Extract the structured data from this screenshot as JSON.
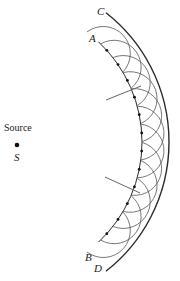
{
  "figure": {
    "labels": {
      "source": "Source",
      "source_symbol": "S",
      "point_a": "A",
      "point_b": "B",
      "point_c": "C",
      "point_d": "D"
    },
    "colors": {
      "line": "#2a2a2a",
      "wavelet": "#555555",
      "ray": "#666666",
      "background": "#ffffff"
    }
  },
  "chart_data": {
    "type": "diagram",
    "center": [
      5,
      142
    ],
    "source_point": [
      17,
      145
    ],
    "inner_wavefront": {
      "name": "AB",
      "radius": 137,
      "start_deg": -47,
      "end_deg": 47
    },
    "outer_wavefront": {
      "name": "CD",
      "radius": 164,
      "start_deg": -52,
      "end_deg": 52
    },
    "wavelet_radius": 27,
    "wavelet_source_angles_deg": [
      -42,
      -34.4,
      -26.7,
      -19.1,
      -11.5,
      -3.8,
      3.8,
      11.5,
      19.1,
      26.7,
      34.4,
      42
    ],
    "rays": [
      {
        "from": [
          106,
          100
        ],
        "to": [
          141,
          86
        ]
      },
      {
        "from": [
          105,
          177
        ],
        "to": [
          140,
          193
        ]
      }
    ]
  }
}
